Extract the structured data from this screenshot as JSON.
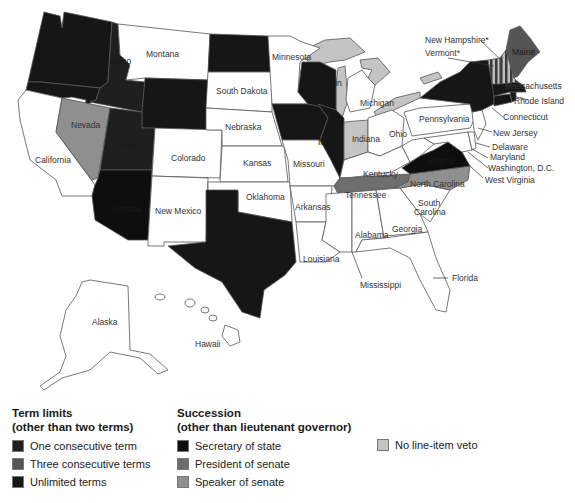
{
  "colors": {
    "one_consecutive_term": "#1f1f1f",
    "three_consecutive_terms": "#555555",
    "unlimited_terms": "#161616",
    "secretary_of_state": "#0e0e0e",
    "president_of_senate": "#6e6e6e",
    "speaker_of_senate": "#8f8f8f",
    "no_line_item_veto": "#c4c4c4",
    "default": "#ffffff"
  },
  "map": {
    "labels": {
      "washington": "Washington",
      "oregon": "Oregon",
      "california": "California",
      "nevada": "Nevada",
      "idaho": "Idaho",
      "montana": "Montana",
      "wyoming": "Wyoming",
      "utah": "Utah",
      "arizona": "Arizona",
      "colorado": "Colorado",
      "new_mexico": "New Mexico",
      "north_dakota": "North Dakota",
      "south_dakota": "South Dakota",
      "nebraska": "Nebraska",
      "kansas": "Kansas",
      "oklahoma": "Oklahoma",
      "texas": "Texas",
      "minnesota": "Minnesota",
      "iowa": "Iowa",
      "missouri": "Missouri",
      "arkansas": "Arkansas",
      "louisiana": "Louisiana",
      "wisconsin": "Wisconsin",
      "illinois": "Illinois",
      "michigan": "Michigan",
      "indiana": "Indiana",
      "ohio": "Ohio",
      "kentucky": "Kentucky",
      "tennessee": "Tennessee",
      "mississippi": "Mississippi",
      "alabama": "Alabama",
      "georgia": "Georgia",
      "florida": "Florida",
      "south_carolina_1": "South",
      "south_carolina_2": "Carolina",
      "north_carolina": "North Carolina",
      "virginia": "Virginia",
      "west_virginia": "West Virginia",
      "washington_dc": "Washington, D.C.",
      "maryland": "Maryland",
      "delaware": "Delaware",
      "new_jersey": "New Jersey",
      "pennsylvania": "Pennsylvania",
      "new_york": "New York",
      "connecticut": "Connecticut",
      "rhode_island": "Rhode Island",
      "massachusetts": "Massachusetts",
      "vermont": "Vermont*",
      "new_hampshire": "New Hampshire*",
      "maine": "Maine",
      "alaska": "Alaska",
      "hawaii": "Hawaii"
    }
  },
  "legend": {
    "term_limits": {
      "title_line1": "Term limits",
      "title_line2": "(other than two terms)",
      "items": [
        {
          "label": "One consecutive term",
          "color": "#1f1f1f"
        },
        {
          "label": "Three consecutive terms",
          "color": "#555555"
        },
        {
          "label": "Unlimited terms",
          "color": "#161616"
        }
      ]
    },
    "succession": {
      "title_line1": "Succession",
      "title_line2": "(other than lieutenant governor)",
      "items": [
        {
          "label": "Secretary of state",
          "color": "#0e0e0e"
        },
        {
          "label": "President of senate",
          "color": "#6e6e6e"
        },
        {
          "label": "Speaker of senate",
          "color": "#8f8f8f"
        }
      ]
    },
    "veto": {
      "items": [
        {
          "label": "No line-item veto",
          "color": "#c4c4c4"
        }
      ]
    }
  }
}
